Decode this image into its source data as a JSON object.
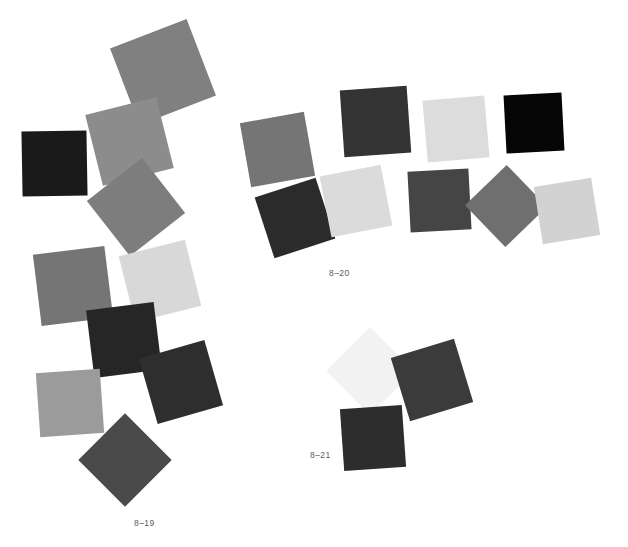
{
  "plate": {
    "background": "#ffffff",
    "width": 628,
    "height": 547,
    "label_color": "#5c5c5c"
  },
  "figures": [
    {
      "id": "fig-8-19",
      "label": "8–19",
      "label_x": 134,
      "label_y": 519,
      "swatch_count": 10,
      "swatches": [
        {
          "name": "swatch-819-1",
          "color": "#808080",
          "x": 122,
          "y": 31,
          "size": 82,
          "rotation": -21
        },
        {
          "name": "swatch-819-2",
          "color": "#8c8c8c",
          "x": 93,
          "y": 105,
          "size": 73,
          "rotation": -14
        },
        {
          "name": "swatch-819-3",
          "color": "#1a1a1a",
          "x": 22,
          "y": 131,
          "size": 65,
          "rotation": -1
        },
        {
          "name": "swatch-819-4",
          "color": "#7d7d7d",
          "x": 101,
          "y": 172,
          "size": 70,
          "rotation": -38
        },
        {
          "name": "swatch-819-5",
          "color": "#757575",
          "x": 37,
          "y": 250,
          "size": 72,
          "rotation": -7
        },
        {
          "name": "swatch-819-6",
          "color": "#d8d8d8",
          "x": 126,
          "y": 247,
          "size": 68,
          "rotation": -14
        },
        {
          "name": "swatch-819-7",
          "color": "#262626",
          "x": 90,
          "y": 306,
          "size": 68,
          "rotation": -7
        },
        {
          "name": "swatch-819-8",
          "color": "#2e2e2e",
          "x": 147,
          "y": 348,
          "size": 68,
          "rotation": -16
        },
        {
          "name": "swatch-819-9",
          "color": "#9b9b9b",
          "x": 38,
          "y": 371,
          "size": 64,
          "rotation": -4
        },
        {
          "name": "swatch-819-10",
          "color": "#4a4a4a",
          "x": 92,
          "y": 427,
          "size": 66,
          "rotation": -45
        }
      ]
    },
    {
      "id": "fig-8-20",
      "label": "8–20",
      "label_x": 329,
      "label_y": 269,
      "swatch_count": 8,
      "swatches": [
        {
          "name": "swatch-820-1",
          "color": "#757575",
          "x": 245,
          "y": 117,
          "size": 65,
          "rotation": -10
        },
        {
          "name": "swatch-820-2",
          "color": "#333333",
          "x": 342,
          "y": 88,
          "size": 67,
          "rotation": -4
        },
        {
          "name": "swatch-820-3",
          "color": "#dcdcdc",
          "x": 425,
          "y": 98,
          "size": 62,
          "rotation": -5
        },
        {
          "name": "swatch-820-4",
          "color": "#060606",
          "x": 505,
          "y": 94,
          "size": 58,
          "rotation": -3
        },
        {
          "name": "swatch-820-5",
          "color": "#2b2b2b",
          "x": 263,
          "y": 186,
          "size": 64,
          "rotation": -18
        },
        {
          "name": "swatch-820-6",
          "color": "#dbdbdb",
          "x": 325,
          "y": 170,
          "size": 62,
          "rotation": -11
        },
        {
          "name": "swatch-820-7",
          "color": "#454545",
          "x": 409,
          "y": 170,
          "size": 61,
          "rotation": -3
        },
        {
          "name": "swatch-820-8",
          "color": "#6f6f6f",
          "x": 477,
          "y": 177,
          "size": 58,
          "rotation": -44
        },
        {
          "name": "swatch-820-9",
          "color": "#d2d2d2",
          "x": 538,
          "y": 182,
          "size": 58,
          "rotation": -9
        }
      ]
    },
    {
      "id": "fig-8-21",
      "label": "8–21",
      "label_x": 310,
      "label_y": 451,
      "swatch_count": 3,
      "swatches": [
        {
          "name": "swatch-821-1",
          "color": "#f2f2f2",
          "x": 339,
          "y": 340,
          "size": 62,
          "rotation": -45
        },
        {
          "name": "swatch-821-2",
          "color": "#3b3b3b",
          "x": 399,
          "y": 347,
          "size": 66,
          "rotation": -17
        },
        {
          "name": "swatch-821-3",
          "color": "#2d2d2d",
          "x": 342,
          "y": 407,
          "size": 62,
          "rotation": -4
        }
      ]
    }
  ]
}
